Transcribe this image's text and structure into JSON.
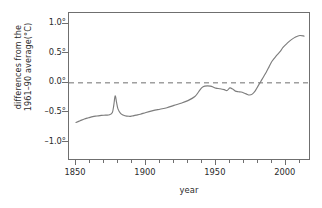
{
  "chart_data": {
    "type": "line",
    "title": "",
    "xlabel": "year",
    "ylabel_line1": "differences from the",
    "ylabel_line2": "1961–90 average(°C)",
    "xlim": [
      1845,
      2018
    ],
    "ylim": [
      -1.32,
      1.18
    ],
    "grid": false,
    "legend": null,
    "xticks": [
      1850,
      1900,
      1950,
      2000
    ],
    "xtick_labels": [
      "1850",
      "1900",
      "1950",
      "2000"
    ],
    "xminor_step": 10,
    "yticks": [
      1.0,
      0.5,
      0.0,
      -0.5,
      -1.0
    ],
    "ytick_labels": [
      "1.0°",
      "0.5°",
      "0.0°",
      "–0.5°",
      "–1.0°"
    ],
    "reference_line": {
      "y": 0.0,
      "style": "dashed",
      "color": "#6f6f6f"
    },
    "series": [
      {
        "name": "global temperature anomaly",
        "color": "#7d7d7d",
        "x": [
          1850,
          1853,
          1856,
          1859,
          1862,
          1865,
          1868,
          1871,
          1874,
          1876,
          1877,
          1878,
          1879,
          1880,
          1882,
          1885,
          1888,
          1890,
          1893,
          1896,
          1900,
          1905,
          1910,
          1915,
          1920,
          1925,
          1930,
          1935,
          1938,
          1940,
          1942,
          1944,
          1946,
          1948,
          1950,
          1953,
          1956,
          1958,
          1960,
          1962,
          1964,
          1966,
          1968,
          1970,
          1972,
          1974,
          1976,
          1978,
          1980,
          1982,
          1984,
          1986,
          1988,
          1990,
          1993,
          1996,
          1998,
          2001,
          2004,
          2007,
          2010,
          2013
        ],
        "y": [
          -0.67,
          -0.64,
          -0.61,
          -0.59,
          -0.57,
          -0.56,
          -0.55,
          -0.545,
          -0.54,
          -0.5,
          -0.38,
          -0.22,
          -0.33,
          -0.44,
          -0.52,
          -0.555,
          -0.565,
          -0.56,
          -0.545,
          -0.53,
          -0.5,
          -0.47,
          -0.445,
          -0.42,
          -0.38,
          -0.345,
          -0.3,
          -0.23,
          -0.14,
          -0.08,
          -0.055,
          -0.05,
          -0.055,
          -0.07,
          -0.09,
          -0.1,
          -0.115,
          -0.13,
          -0.085,
          -0.105,
          -0.14,
          -0.15,
          -0.155,
          -0.17,
          -0.19,
          -0.205,
          -0.19,
          -0.14,
          -0.06,
          0.02,
          0.1,
          0.18,
          0.27,
          0.36,
          0.45,
          0.53,
          0.6,
          0.67,
          0.73,
          0.775,
          0.8,
          0.79
        ]
      }
    ]
  }
}
